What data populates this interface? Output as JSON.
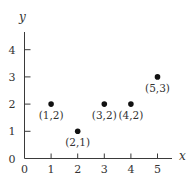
{
  "chart_data": {
    "type": "scatter",
    "title": "",
    "xlabel": "x",
    "ylabel": "y",
    "xlim": [
      0,
      5.5
    ],
    "ylim": [
      0,
      4.6
    ],
    "grid": false,
    "legend": null,
    "x_ticks": [
      "0",
      "1",
      "2",
      "3",
      "4",
      "5"
    ],
    "y_ticks": [
      "0",
      "1",
      "2",
      "3",
      "4"
    ],
    "points": [
      {
        "x": 1,
        "y": 2,
        "label": "(1,2)"
      },
      {
        "x": 2,
        "y": 1,
        "label": "(2,1)"
      },
      {
        "x": 3,
        "y": 2,
        "label": "(3,2)"
      },
      {
        "x": 4,
        "y": 2,
        "label": "(4,2)"
      },
      {
        "x": 5,
        "y": 3,
        "label": "(5,3)"
      }
    ]
  },
  "colors": {
    "axis": "#3a3a3a",
    "point": "#111111",
    "text": "#333333",
    "background": "#ffffff"
  }
}
